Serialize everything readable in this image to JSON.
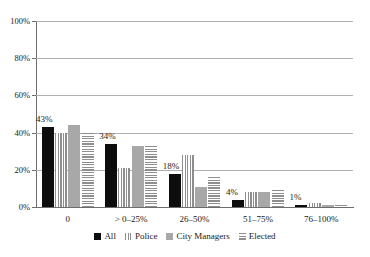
{
  "chart_data": {
    "type": "bar",
    "title": "",
    "subtitle": "",
    "xlabel": "",
    "ylabel": "",
    "ylim": [
      0,
      100
    ],
    "ytick_labels": [
      "0%",
      "20%",
      "40%",
      "60%",
      "80%",
      "100%"
    ],
    "ytick_values": [
      0,
      20,
      40,
      60,
      80,
      100
    ],
    "grid": true,
    "legend_position": "bottom",
    "categories": [
      "0",
      "> 0–25%",
      "26–50%",
      "51–75%",
      "76–100%"
    ],
    "series": [
      {
        "name": "All",
        "fill": "solid-black",
        "color": "#0d0d0d",
        "values": [
          43,
          34,
          18,
          4,
          1
        ],
        "data_labels": [
          "43%",
          "34%",
          "18%",
          "4%",
          "1%"
        ]
      },
      {
        "name": "Police",
        "fill": "vertical-stripes",
        "color": "#8e8e8e",
        "values": [
          40,
          21,
          28,
          8,
          2
        ],
        "data_labels": [
          "",
          "",
          "",
          "",
          ""
        ]
      },
      {
        "name": "City Managers",
        "fill": "solid-gray",
        "color": "#a8a8a8",
        "values": [
          44,
          33,
          11,
          8,
          1
        ],
        "data_labels": [
          "",
          "",
          "",
          "",
          ""
        ]
      },
      {
        "name": "Elected",
        "fill": "horizontal-stripes",
        "color": "#8e8e8e",
        "values": [
          40,
          33,
          16,
          9,
          1
        ],
        "data_labels": [
          "",
          "",
          "",
          "",
          ""
        ]
      }
    ]
  },
  "legend": {
    "items": [
      {
        "label": "All"
      },
      {
        "label": "Police"
      },
      {
        "label": "City Managers"
      },
      {
        "label": "Elected"
      }
    ]
  },
  "axis": {
    "y_labels": [
      "100%",
      "80%",
      "60%",
      "40%",
      "20%",
      "0%"
    ],
    "x_labels": [
      "0",
      "> 0–25%",
      "26–50%",
      "51–75%",
      "76–100%"
    ]
  }
}
